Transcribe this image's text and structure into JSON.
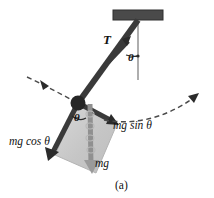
{
  "figure": {
    "caption": "(a)",
    "background_color": "#ffffff"
  },
  "colors": {
    "rod": "#3a3a3a",
    "bob": "#262626",
    "ceiling": "#4a4a4a",
    "vertical_reference": "#9a9a9a",
    "shaded_region": "#c9c9c9",
    "shaded_region_edge": "#b0b0b0",
    "dashed_arc": "#4a4a4a",
    "mg_arrow": "#8f8f8f",
    "text": "#111111"
  },
  "labels": {
    "tension": "T",
    "angle_top": "θ",
    "angle_bob": "θ",
    "mg_sin_theta": "mg sin θ",
    "mg_cos_theta": "mg cos θ",
    "mg": "mg"
  },
  "elements": {
    "ceiling_support": "ceiling-support-bar",
    "pendulum_rod": "pendulum-rod",
    "pendulum_bob": "pendulum-bob",
    "vertical_line": "vertical-reference-line",
    "tension_vector": "tension-force-vector",
    "weight_vector": "weight-force-vector",
    "tangential_component": "mg-sin-theta-component-vector",
    "radial_component": "mg-cos-theta-component-vector",
    "swing_arc_left": "swing-direction-arc-left",
    "swing_arc_right": "swing-direction-arc-right",
    "force_parallelogram": "force-decomposition-parallelogram"
  },
  "geometry": {
    "ceiling": {
      "x": 113,
      "y": 10,
      "width": 50,
      "height": 10
    },
    "pivot": {
      "x": 138,
      "y": 20
    },
    "bob": {
      "x": 78,
      "y": 103,
      "radius": 7
    },
    "vertical_line_end": {
      "x": 138,
      "y": 80
    },
    "tension_tip": {
      "x": 128,
      "y": 39
    },
    "mg_cos_tip": {
      "x": 50,
      "y": 158
    },
    "mg_sin_tip": {
      "x": 117,
      "y": 125
    },
    "mg_tip": {
      "x": 93,
      "y": 172
    }
  }
}
